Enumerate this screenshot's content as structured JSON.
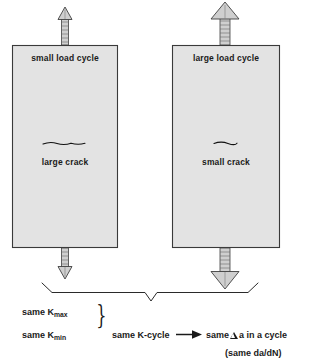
{
  "diagram": {
    "colors": {
      "specimen_fill": "#e3e3e3",
      "specimen_stroke": "#3a3a3a",
      "ink": "#1a1a1a",
      "arrow_fill": "#cfcfcf",
      "arrow_stroke": "#3f3f3f",
      "background": "#ffffff"
    },
    "specimens": [
      {
        "id": "left-specimen",
        "load_label": "small load cycle",
        "crack_label": "large crack",
        "crack_size": "large",
        "load_size": "small",
        "top_arrow": "up-arrow-small",
        "bottom_arrow": "down-arrow-small"
      },
      {
        "id": "right-specimen",
        "load_label": "large load cycle",
        "crack_label": "small crack",
        "crack_size": "small",
        "load_size": "large",
        "top_arrow": "up-arrow-large",
        "bottom_arrow": "down-arrow-large"
      }
    ],
    "conclusion": {
      "kmax_prefix": "same K",
      "kmax_sub": "max",
      "kmin_prefix": "same K",
      "kmin_sub": "min",
      "brace_glyph": "}",
      "k_cycle": "same K-cycle",
      "arrow_glyph": "➞",
      "result_prefix": "same",
      "result_delta_symbol": "delta-triangle-icon",
      "result_suffix": "a in a cycle",
      "result_note": "(same da/dN)"
    }
  }
}
